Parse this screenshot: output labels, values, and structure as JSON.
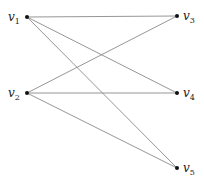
{
  "graph": {
    "type": "bipartite",
    "nodes": [
      {
        "id": "v1",
        "label": "v",
        "sub": "1",
        "x": 27,
        "y": 17,
        "lx": 8,
        "ly": 21
      },
      {
        "id": "v2",
        "label": "v",
        "sub": "2",
        "x": 27,
        "y": 93,
        "lx": 8,
        "ly": 97
      },
      {
        "id": "v3",
        "label": "v",
        "sub": "3",
        "x": 177,
        "y": 16,
        "lx": 183,
        "ly": 20
      },
      {
        "id": "v4",
        "label": "v",
        "sub": "4",
        "x": 177,
        "y": 93,
        "lx": 183,
        "ly": 97
      },
      {
        "id": "v5",
        "label": "v",
        "sub": "5",
        "x": 177,
        "y": 168,
        "lx": 183,
        "ly": 172
      }
    ],
    "edges": [
      [
        "v1",
        "v3"
      ],
      [
        "v1",
        "v4"
      ],
      [
        "v1",
        "v5"
      ],
      [
        "v2",
        "v3"
      ],
      [
        "v2",
        "v4"
      ],
      [
        "v2",
        "v5"
      ]
    ],
    "colors": {
      "edge": "#8a8a8a",
      "node": "#111111"
    }
  }
}
